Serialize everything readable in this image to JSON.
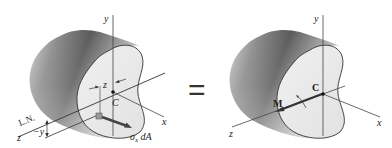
{
  "figure": {
    "left": {
      "labels": {
        "y_axis": "y",
        "x_axis": "x",
        "z_axis": "z",
        "centroid": "C",
        "z_dim": "z",
        "neutral_axis": "L.N.",
        "neg_y": "−y",
        "force_sigma": "σ",
        "force_sub": "x",
        "force_dA": " dA"
      }
    },
    "equals": "=",
    "right": {
      "labels": {
        "y_axis": "y",
        "x_axis": "x",
        "z_axis": "z",
        "centroid": "C",
        "moment": "M"
      }
    }
  }
}
